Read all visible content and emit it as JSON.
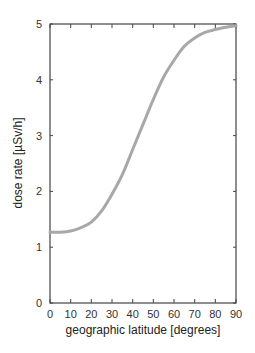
{
  "chart_data": {
    "type": "line",
    "title": "",
    "xlabel": "geographic latitude [degrees]",
    "ylabel": "dose rate [µSv/h]",
    "xlim": [
      0,
      90
    ],
    "ylim": [
      0,
      5
    ],
    "xticks": [
      0,
      10,
      20,
      30,
      40,
      50,
      60,
      70,
      80,
      90
    ],
    "yticks": [
      0,
      1,
      2,
      3,
      4,
      5
    ],
    "grid": false,
    "legend": null,
    "series": [
      {
        "name": "dose rate",
        "color": "#a8a8a8",
        "x": [
          0,
          5,
          10,
          15,
          20,
          25,
          30,
          35,
          40,
          45,
          50,
          55,
          60,
          65,
          70,
          75,
          80,
          85,
          90
        ],
        "y": [
          1.27,
          1.27,
          1.29,
          1.35,
          1.45,
          1.65,
          1.95,
          2.3,
          2.75,
          3.2,
          3.65,
          4.05,
          4.35,
          4.6,
          4.75,
          4.85,
          4.9,
          4.94,
          4.97
        ]
      }
    ]
  },
  "layout": {
    "plot_left": 50,
    "plot_right": 236,
    "plot_top": 24,
    "plot_bottom": 303
  }
}
